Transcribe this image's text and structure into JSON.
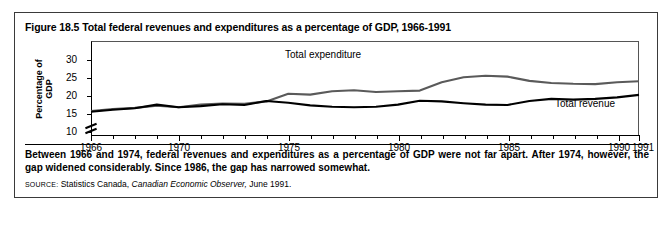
{
  "figure": {
    "title": "Figure 18.5 Total federal revenues and expenditures as a percentage of GDP, 1966-1991",
    "caption": "Between 1966 and 1974, federal revenues and expenditures as a percentage of GDP were not far apart. After 1974, however, the gap widened considerably. Since 1986, the gap has narrowed somewhat.",
    "source_prefix": "SOURCE:",
    "source_text_1": "Statistics Canada,",
    "source_italic": "Canadian Economic Observer,",
    "source_text_2": "June 1991."
  },
  "chart_data": {
    "type": "line",
    "title": "Figure 18.5 Total federal revenues and expenditures as a percentage of GDP, 1966-1991",
    "xlabel": "",
    "ylabel": "Percentage of GDP",
    "xlim": [
      1966,
      1991
    ],
    "ylim": [
      10,
      30
    ],
    "yticks": [
      10,
      15,
      20,
      25,
      30
    ],
    "xticks": [
      1966,
      1970,
      1975,
      1980,
      1985,
      1990,
      1991
    ],
    "xtick_labels": [
      "1966",
      "1970",
      "1975",
      "1980",
      "1985",
      "1990",
      "1991"
    ],
    "axis_break": true,
    "grid": false,
    "legend": "inline-labels",
    "x": [
      1966,
      1967,
      1968,
      1969,
      1970,
      1971,
      1972,
      1973,
      1974,
      1975,
      1976,
      1977,
      1978,
      1979,
      1980,
      1981,
      1982,
      1983,
      1984,
      1985,
      1986,
      1987,
      1988,
      1989,
      1990,
      1991
    ],
    "series": [
      {
        "name": "Total expenditure",
        "color": "#5a5a5a",
        "values": [
          15.8,
          16.4,
          16.7,
          17.3,
          16.9,
          17.6,
          17.9,
          17.8,
          18.5,
          20.6,
          20.4,
          21.3,
          21.6,
          21.1,
          21.3,
          21.5,
          23.8,
          25.2,
          25.6,
          25.4,
          24.2,
          23.6,
          23.4,
          23.3,
          23.8,
          24.1
        ]
      },
      {
        "name": "Total revenue",
        "color": "#000000",
        "values": [
          15.6,
          16.2,
          16.6,
          17.6,
          16.9,
          17.2,
          17.7,
          17.5,
          18.6,
          18.1,
          17.4,
          17.0,
          16.9,
          17.0,
          17.6,
          18.7,
          18.5,
          18.0,
          17.6,
          17.5,
          18.6,
          19.2,
          19.0,
          19.2,
          19.6,
          20.3
        ]
      }
    ],
    "annotations": [
      {
        "text": "Total expenditure",
        "x": 1975.2,
        "y": 27.6
      },
      {
        "text": "Total revenue",
        "x": 1986.4,
        "y": 17.1
      }
    ]
  }
}
